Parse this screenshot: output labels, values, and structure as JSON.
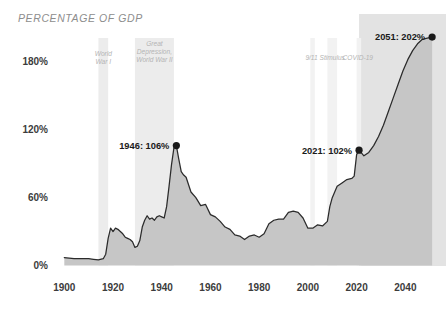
{
  "chart_data": {
    "type": "area",
    "title": "PERCENTAGE OF GDP",
    "xlabel": "",
    "ylabel": "",
    "xlim": [
      1897,
      2053
    ],
    "ylim": [
      0,
      210
    ],
    "grid": false,
    "legend": "none",
    "x_ticks": [
      "1900",
      "1920",
      "1940",
      "1960",
      "1980",
      "2000",
      "2020",
      "2040"
    ],
    "x_tick_values": [
      1900,
      1920,
      1940,
      1960,
      1980,
      2000,
      2020,
      2040
    ],
    "y_ticks": [
      "0%",
      "60%",
      "120%",
      "180%"
    ],
    "y_tick_values": [
      0,
      60,
      120,
      180
    ],
    "series": [
      {
        "name": "Federal debt held by the public (% of GDP)",
        "x": [
          1900,
          1902,
          1904,
          1906,
          1908,
          1910,
          1912,
          1914,
          1916,
          1917,
          1918,
          1919,
          1920,
          1921,
          1922,
          1923,
          1924,
          1925,
          1926,
          1927,
          1928,
          1929,
          1930,
          1931,
          1932,
          1933,
          1934,
          1935,
          1936,
          1937,
          1938,
          1939,
          1940,
          1941,
          1942,
          1943,
          1944,
          1945,
          1946,
          1947,
          1948,
          1949,
          1950,
          1952,
          1954,
          1956,
          1958,
          1960,
          1962,
          1964,
          1966,
          1968,
          1970,
          1972,
          1974,
          1976,
          1978,
          1980,
          1982,
          1984,
          1986,
          1988,
          1990,
          1992,
          1994,
          1996,
          1998,
          2000,
          2002,
          2004,
          2006,
          2008,
          2009,
          2010,
          2012,
          2014,
          2016,
          2018,
          2019,
          2020,
          2021,
          2023,
          2025,
          2027,
          2029,
          2031,
          2033,
          2035,
          2037,
          2039,
          2041,
          2043,
          2045,
          2047,
          2049,
          2051
        ],
        "y": [
          7,
          6.5,
          6,
          6,
          6,
          6,
          5.5,
          5,
          6,
          10,
          24,
          33,
          30,
          33,
          32,
          30,
          28,
          25,
          24,
          23,
          21,
          16,
          17,
          22,
          34,
          40,
          44,
          41,
          42,
          40,
          43,
          44,
          43,
          42,
          52,
          70,
          89,
          104,
          106,
          94,
          83,
          80,
          78,
          65,
          60,
          53,
          54,
          45,
          43,
          39,
          34,
          32,
          27,
          26,
          23,
          26,
          27,
          25,
          28,
          37,
          40,
          41,
          41,
          47,
          48,
          47,
          42,
          33,
          33,
          36,
          35,
          39,
          52,
          60,
          70,
          73,
          76,
          77,
          79,
          98,
          102,
          97,
          100,
          106,
          114,
          124,
          136,
          148,
          160,
          172,
          182,
          190,
          196,
          200,
          201,
          202
        ]
      }
    ],
    "annotations": [
      {
        "label": "1946: 106%",
        "x": 1946,
        "y": 106,
        "align": "right"
      },
      {
        "label": "2021: 102%",
        "x": 2021,
        "y": 102,
        "align": "right"
      },
      {
        "label": "2051: 202%",
        "x": 2051,
        "y": 202,
        "align": "right"
      }
    ],
    "event_bands": [
      {
        "label": "World War I",
        "lines": [
          "World",
          "War I"
        ],
        "start": 1914,
        "end": 1918
      },
      {
        "label": "Great Depression, World War II",
        "lines": [
          "Great",
          "Depression,",
          "World War II"
        ],
        "start": 1929,
        "end": 1945
      },
      {
        "label": "9/11",
        "lines": [
          "9/11"
        ],
        "start": 2001,
        "end": 2002
      },
      {
        "label": "Stimulus",
        "lines": [
          "Stimulus"
        ],
        "start": 2008,
        "end": 2012
      },
      {
        "label": "COVID-19",
        "lines": [
          "COVID-19"
        ],
        "start": 2020,
        "end": 2021
      }
    ],
    "projection": {
      "label": "",
      "start": 2021,
      "end": 2051
    }
  },
  "colors": {
    "line": "#2b2b2b",
    "area": "#c6c6c6",
    "band": "#ececec",
    "projection": "#e3e3e3",
    "title_text": "#8d8d8d",
    "tick_text": "#3c3c3c",
    "event_text": "#b4b4b4",
    "annotation_text": "#1a1a1a",
    "background": "#ffffff"
  }
}
